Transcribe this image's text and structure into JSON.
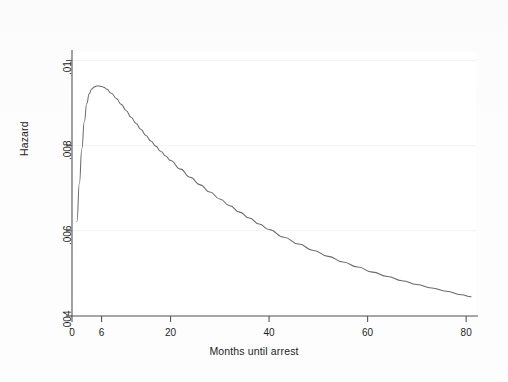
{
  "figure": {
    "background_color": "#fdfdfd",
    "plot_background_color": "#ffffff",
    "line_color": "#6b6b6b",
    "axis_color": "#4a4a4a",
    "grid_color": "#f2f2f2",
    "text_color": "#1d1d1d"
  },
  "chart_data": {
    "type": "line",
    "title": "",
    "xlabel": "Months until arrest",
    "ylabel": "Hazard",
    "xlim": [
      0,
      82
    ],
    "ylim": [
      0.004,
      0.0102
    ],
    "grid": true,
    "legend": "none",
    "xticks": [
      0,
      6,
      20,
      40,
      60,
      80
    ],
    "xticklabels": [
      "0",
      "6",
      "20",
      "40",
      "60",
      "80"
    ],
    "yticks": [
      0.004,
      0.006,
      0.008,
      0.01
    ],
    "yticklabels": [
      ".004",
      ".006",
      ".008",
      ".01"
    ],
    "series": [
      {
        "name": "Smoothed hazard estimate",
        "x": [
          1,
          1.5,
          2,
          2.5,
          3,
          3.5,
          4,
          4.5,
          5,
          5.5,
          6,
          6.5,
          7,
          8,
          9,
          10,
          11,
          12,
          13,
          14,
          15,
          16,
          17,
          18,
          19,
          20,
          22,
          24,
          26,
          28,
          30,
          32,
          34,
          36,
          38,
          40,
          43,
          46,
          49,
          52,
          55,
          58,
          61,
          64,
          67,
          70,
          73,
          76,
          79,
          81
        ],
        "y": [
          0.00622,
          0.00712,
          0.00793,
          0.00856,
          0.00899,
          0.00922,
          0.00933,
          0.00938,
          0.0094,
          0.0094,
          0.00939,
          0.00937,
          0.00933,
          0.00923,
          0.00911,
          0.00897,
          0.00882,
          0.00867,
          0.00852,
          0.00838,
          0.00824,
          0.00811,
          0.00799,
          0.00787,
          0.00776,
          0.00765,
          0.00745,
          0.00726,
          0.00708,
          0.00691,
          0.00675,
          0.00659,
          0.00644,
          0.0063,
          0.00616,
          0.00603,
          0.00585,
          0.00569,
          0.00554,
          0.0054,
          0.00527,
          0.00515,
          0.00503,
          0.00493,
          0.00483,
          0.00474,
          0.00466,
          0.00458,
          0.0045,
          0.00445
        ]
      }
    ]
  }
}
